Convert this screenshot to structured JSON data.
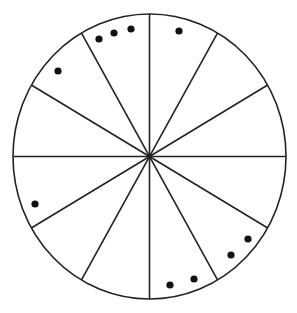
{
  "diagram": {
    "type": "segmented-circle",
    "segments": 12,
    "center": [
      148,
      156
    ],
    "rx": 136,
    "ry": 142.5,
    "stroke_color": "#222222",
    "stroke_width": 1.6,
    "dot_color": "#111111",
    "dot_radius": 3.6,
    "dots": [
      {
        "x": 99,
        "y": 39
      },
      {
        "x": 114,
        "y": 33
      },
      {
        "x": 131,
        "y": 29
      },
      {
        "x": 179,
        "y": 31
      },
      {
        "x": 58,
        "y": 71
      },
      {
        "x": 35,
        "y": 204
      },
      {
        "x": 248,
        "y": 239
      },
      {
        "x": 231,
        "y": 255
      },
      {
        "x": 194,
        "y": 279
      },
      {
        "x": 170,
        "y": 285
      }
    ]
  }
}
